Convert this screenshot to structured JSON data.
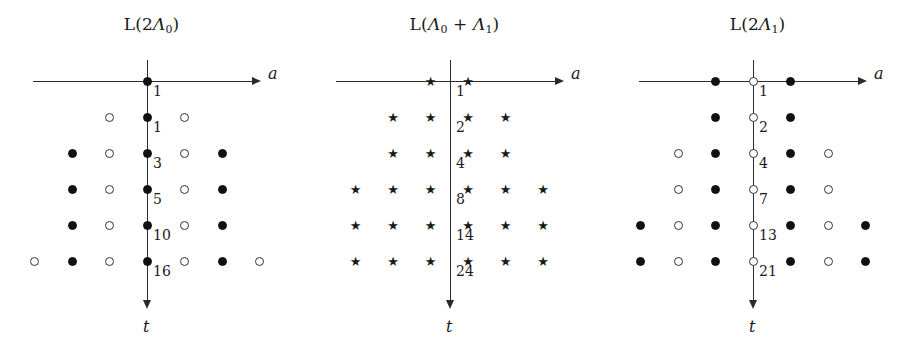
{
  "figure": {
    "width": 908,
    "height": 350,
    "background": "#ffffff",
    "ink": "#1a1a1a"
  },
  "axis_labels": {
    "horizontal": "a",
    "vertical": "t"
  },
  "panels": [
    {
      "id": "panel-2lambda0",
      "title_prefix": "L(2",
      "title_lambda": "Λ",
      "title_sub": "0",
      "title_suffix": ")",
      "title_full": "L(2Λ₀)",
      "marker_style": "circle",
      "axis_marker": "filled",
      "multiplicities": [
        "1",
        "1",
        "3",
        "5",
        "10",
        "16"
      ],
      "rows": [
        {
          "t": 0,
          "label": "1",
          "cells": [
            {
              "x": 0,
              "m": "filled"
            }
          ]
        },
        {
          "t": 1,
          "label": "1",
          "cells": [
            {
              "x": -1,
              "m": "open"
            },
            {
              "x": 0,
              "m": "filled"
            },
            {
              "x": 1,
              "m": "open"
            }
          ]
        },
        {
          "t": 2,
          "label": "3",
          "cells": [
            {
              "x": -2,
              "m": "filled"
            },
            {
              "x": -1,
              "m": "open"
            },
            {
              "x": 0,
              "m": "filled"
            },
            {
              "x": 1,
              "m": "open"
            },
            {
              "x": 2,
              "m": "filled"
            }
          ]
        },
        {
          "t": 3,
          "label": "5",
          "cells": [
            {
              "x": -2,
              "m": "filled"
            },
            {
              "x": -1,
              "m": "open"
            },
            {
              "x": 0,
              "m": "filled"
            },
            {
              "x": 1,
              "m": "open"
            },
            {
              "x": 2,
              "m": "filled"
            }
          ]
        },
        {
          "t": 4,
          "label": "10",
          "cells": [
            {
              "x": -2,
              "m": "filled"
            },
            {
              "x": -1,
              "m": "open"
            },
            {
              "x": 0,
              "m": "filled"
            },
            {
              "x": 1,
              "m": "open"
            },
            {
              "x": 2,
              "m": "filled"
            }
          ]
        },
        {
          "t": 5,
          "label": "16",
          "cells": [
            {
              "x": -3,
              "m": "open"
            },
            {
              "x": -2,
              "m": "filled"
            },
            {
              "x": -1,
              "m": "open"
            },
            {
              "x": 0,
              "m": "filled"
            },
            {
              "x": 1,
              "m": "open"
            },
            {
              "x": 2,
              "m": "filled"
            },
            {
              "x": 3,
              "m": "open"
            }
          ]
        }
      ]
    },
    {
      "id": "panel-lambda0-plus-lambda1",
      "title_prefix": "L(",
      "title_lambda": "Λ",
      "title_sub": "0",
      "title_suffix": ")",
      "title_full": "L(Λ₀ + Λ₁)",
      "marker_style": "star",
      "axis_marker": "star",
      "multiplicities": [
        "1",
        "2",
        "4",
        "8",
        "14",
        "24"
      ],
      "rows": [
        {
          "t": 0,
          "label": "1",
          "cells": [
            {
              "x": -0.5,
              "m": "star"
            },
            {
              "x": 0.5,
              "m": "star"
            }
          ]
        },
        {
          "t": 1,
          "label": "2",
          "cells": [
            {
              "x": -1.5,
              "m": "star"
            },
            {
              "x": -0.5,
              "m": "star"
            },
            {
              "x": 0.5,
              "m": "star"
            },
            {
              "x": 1.5,
              "m": "star"
            }
          ]
        },
        {
          "t": 2,
          "label": "4",
          "cells": [
            {
              "x": -1.5,
              "m": "star"
            },
            {
              "x": -0.5,
              "m": "star"
            },
            {
              "x": 0.5,
              "m": "star"
            },
            {
              "x": 1.5,
              "m": "star"
            }
          ]
        },
        {
          "t": 3,
          "label": "8",
          "cells": [
            {
              "x": -2.5,
              "m": "star"
            },
            {
              "x": -1.5,
              "m": "star"
            },
            {
              "x": -0.5,
              "m": "star"
            },
            {
              "x": 0.5,
              "m": "star"
            },
            {
              "x": 1.5,
              "m": "star"
            },
            {
              "x": 2.5,
              "m": "star"
            }
          ]
        },
        {
          "t": 4,
          "label": "14",
          "cells": [
            {
              "x": -2.5,
              "m": "star"
            },
            {
              "x": -1.5,
              "m": "star"
            },
            {
              "x": -0.5,
              "m": "star"
            },
            {
              "x": 0.5,
              "m": "star"
            },
            {
              "x": 1.5,
              "m": "star"
            },
            {
              "x": 2.5,
              "m": "star"
            }
          ]
        },
        {
          "t": 5,
          "label": "24",
          "cells": [
            {
              "x": -2.5,
              "m": "star"
            },
            {
              "x": -1.5,
              "m": "star"
            },
            {
              "x": -0.5,
              "m": "star"
            },
            {
              "x": 0.5,
              "m": "star"
            },
            {
              "x": 1.5,
              "m": "star"
            },
            {
              "x": 2.5,
              "m": "star"
            }
          ]
        }
      ]
    },
    {
      "id": "panel-2lambda1",
      "title_prefix": "L(2",
      "title_lambda": "Λ",
      "title_sub": "1",
      "title_suffix": ")",
      "title_full": "L(2Λ₁)",
      "marker_style": "circle",
      "axis_marker": "open",
      "multiplicities": [
        "1",
        "2",
        "4",
        "7",
        "13",
        "21"
      ],
      "rows": [
        {
          "t": 0,
          "label": "1",
          "cells": [
            {
              "x": -1,
              "m": "filled"
            },
            {
              "x": 0,
              "m": "open"
            },
            {
              "x": 1,
              "m": "filled"
            }
          ]
        },
        {
          "t": 1,
          "label": "2",
          "cells": [
            {
              "x": -1,
              "m": "filled"
            },
            {
              "x": 0,
              "m": "open"
            },
            {
              "x": 1,
              "m": "filled"
            }
          ]
        },
        {
          "t": 2,
          "label": "4",
          "cells": [
            {
              "x": -2,
              "m": "open"
            },
            {
              "x": -1,
              "m": "filled"
            },
            {
              "x": 0,
              "m": "open"
            },
            {
              "x": 1,
              "m": "filled"
            },
            {
              "x": 2,
              "m": "open"
            }
          ]
        },
        {
          "t": 3,
          "label": "7",
          "cells": [
            {
              "x": -2,
              "m": "open"
            },
            {
              "x": -1,
              "m": "filled"
            },
            {
              "x": 0,
              "m": "open"
            },
            {
              "x": 1,
              "m": "filled"
            },
            {
              "x": 2,
              "m": "open"
            }
          ]
        },
        {
          "t": 4,
          "label": "13",
          "cells": [
            {
              "x": -3,
              "m": "filled"
            },
            {
              "x": -2,
              "m": "open"
            },
            {
              "x": -1,
              "m": "filled"
            },
            {
              "x": 0,
              "m": "open"
            },
            {
              "x": 1,
              "m": "filled"
            },
            {
              "x": 2,
              "m": "open"
            },
            {
              "x": 3,
              "m": "filled"
            }
          ]
        },
        {
          "t": 5,
          "label": "21",
          "cells": [
            {
              "x": -3,
              "m": "filled"
            },
            {
              "x": -2,
              "m": "open"
            },
            {
              "x": -1,
              "m": "filled"
            },
            {
              "x": 0,
              "m": "open"
            },
            {
              "x": 1,
              "m": "filled"
            },
            {
              "x": 2,
              "m": "open"
            },
            {
              "x": 3,
              "m": "filled"
            }
          ]
        }
      ]
    }
  ],
  "geometry": {
    "panel_width": 303,
    "origin_x": 147,
    "origin_y": 81,
    "col_step": 37.5,
    "row_step": 36,
    "axis_left": 33,
    "axis_right": 252,
    "axis_bottom": 300
  },
  "star_glyph": "★"
}
